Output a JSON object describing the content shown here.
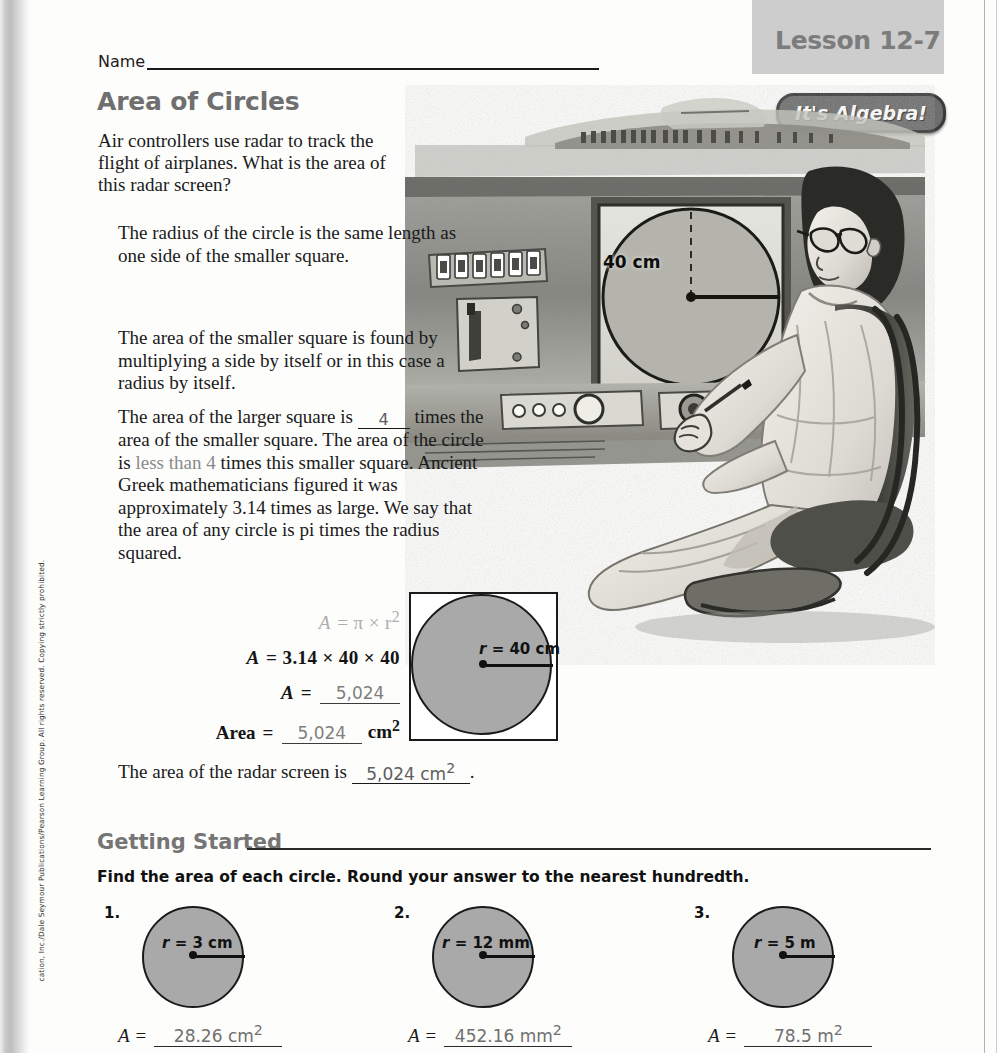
{
  "header": {
    "lesson_label": "Lesson 12-7",
    "algebra_badge": "It's Algebra!",
    "name_label": "Name",
    "title": "Area of Circles"
  },
  "intro": {
    "paragraph": "Air controllers use radar to track the flight of airplanes. What is the area of this radar screen?"
  },
  "steps": {
    "step1": "The radius of the circle is the same length as one side of the smaller square.",
    "step2": "The area of the smaller square is found by multiplying a side by itself or in this case a radius by itself.",
    "step3_a": "The area of the larger square is",
    "step3_blank": "4",
    "step3_b": "times the area of the smaller square. The area of the circle is",
    "step3_answer": "less than 4",
    "step3_c": "times this smaller square. Ancient Greek mathematicians figured it was approximately 3.14 times as large. We say that the area of any circle is pi times the radius squared."
  },
  "formula": {
    "row1_lhs": "A",
    "row1_rhs": "= π × r",
    "row1_exp": "2",
    "row2_lhs": "A",
    "row2_rhs": "= 3.14 × 40 × 40",
    "row3_lhs": "A",
    "row3_eq": "=",
    "row3_answer": "5,024",
    "row4_lhs": "Area",
    "row4_eq": "=",
    "row4_answer": "5,024",
    "row4_unit": "cm",
    "row4_unit_exp": "2"
  },
  "diagram": {
    "radius_var": "r",
    "radius_value": "= 40 cm"
  },
  "illustration": {
    "radar_label": "40 cm"
  },
  "answer_sentence": {
    "prefix": "The area of the radar screen is",
    "answer": "5,024 cm",
    "answer_exp": "2",
    "suffix": "."
  },
  "getting_started": {
    "heading": "Getting Started",
    "instruction": "Find the area of each circle. Round your answer to the nearest hundredth."
  },
  "exercises": [
    {
      "number": "1.",
      "radius_var": "r",
      "radius_value": "= 3 cm",
      "a_label": "A",
      "equals": "=",
      "answer": "28.26 cm",
      "answer_exp": "2"
    },
    {
      "number": "2.",
      "radius_var": "r",
      "radius_value": "= 12 mm",
      "a_label": "A",
      "equals": "=",
      "answer": "452.16 mm",
      "answer_exp": "2"
    },
    {
      "number": "3.",
      "radius_var": "r",
      "radius_value": "= 5 m",
      "a_label": "A",
      "equals": "=",
      "answer": "78.5 m",
      "answer_exp": "2"
    }
  ],
  "copyright": "cation, Inc./Dale Seymour Publications/Pearson Learning Group. All rights reserved. Copying strictly prohibited.",
  "colors": {
    "title_gray": "#6f6f6f",
    "shape_fill": "#a9a9a9",
    "lesson_tab_bg": "#cdcdcd",
    "badge_bg": "#6e6e6e",
    "answer_gray": "#7f7f7f"
  }
}
